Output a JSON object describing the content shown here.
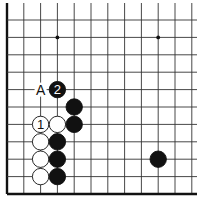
{
  "diagram": {
    "type": "go-board",
    "columns": 12,
    "rows": 11,
    "edges": [
      "left",
      "bottom"
    ],
    "star_points": [
      [
        3,
        1
      ],
      [
        9,
        1
      ]
    ],
    "stones": [
      {
        "color": "black",
        "col": 3,
        "row": 4,
        "label": "2"
      },
      {
        "color": "black",
        "col": 4,
        "row": 5,
        "label": ""
      },
      {
        "color": "white",
        "col": 2,
        "row": 6,
        "label": "1"
      },
      {
        "color": "white",
        "col": 3,
        "row": 6,
        "label": ""
      },
      {
        "color": "black",
        "col": 4,
        "row": 6,
        "label": ""
      },
      {
        "color": "white",
        "col": 2,
        "row": 7,
        "label": ""
      },
      {
        "color": "black",
        "col": 3,
        "row": 7,
        "label": ""
      },
      {
        "color": "white",
        "col": 2,
        "row": 8,
        "label": ""
      },
      {
        "color": "black",
        "col": 3,
        "row": 8,
        "label": ""
      },
      {
        "color": "white",
        "col": 2,
        "row": 9,
        "label": ""
      },
      {
        "color": "black",
        "col": 3,
        "row": 9,
        "label": ""
      },
      {
        "color": "black",
        "col": 9,
        "row": 8,
        "label": ""
      }
    ],
    "markers": [
      {
        "text": "A",
        "col": 2,
        "row": 4
      }
    ],
    "colors": {
      "line": "#333333",
      "edge": "#111111",
      "black_stone": "#111111",
      "white_stone": "#ffffff",
      "background": "#ffffff"
    }
  }
}
